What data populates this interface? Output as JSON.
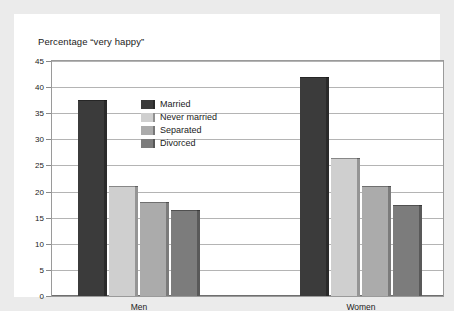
{
  "chart_data": {
    "type": "bar",
    "title": "Percentage “very happy”",
    "xlabel": "",
    "ylabel": "",
    "categories": [
      "Men",
      "Women"
    ],
    "series": [
      {
        "name": "Married",
        "values": [
          37.5,
          42.0
        ],
        "color": "#3b3b3b"
      },
      {
        "name": "Never married",
        "values": [
          21.0,
          26.5
        ],
        "color": "#cfcfcf"
      },
      {
        "name": "Separated",
        "values": [
          18.0,
          21.0
        ],
        "color": "#ababab"
      },
      {
        "name": "Divorced",
        "values": [
          16.5,
          17.5
        ],
        "color": "#7c7c7c"
      }
    ],
    "ylim": [
      0,
      45
    ],
    "ytick_step": 5,
    "yticks": [
      0,
      5,
      10,
      15,
      20,
      25,
      30,
      35,
      40,
      45
    ],
    "ytick_labels": [
      "0",
      "5",
      "10",
      "15",
      "20",
      "25",
      "30",
      "35",
      "40",
      "45"
    ],
    "grid": true,
    "grid_axis": "y",
    "legend_position": "upper-center-left",
    "bar_edge_color": "#5a5a5a",
    "plot_background": "#ffffff",
    "figure_background": "#ebebeb",
    "frame_color": "#9a9a9a",
    "gridline_color": "#b4b4b4",
    "text_color": "#1b1b1b"
  },
  "legend": {
    "items": [
      {
        "label": "Married"
      },
      {
        "label": "Never married"
      },
      {
        "label": "Separated"
      },
      {
        "label": "Divorced"
      }
    ]
  }
}
